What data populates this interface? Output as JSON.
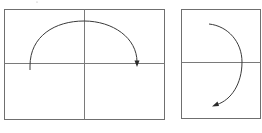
{
  "colors": {
    "frame": "#6f6f6f",
    "axis": "#7a7a7a",
    "arc": "#3a3a3a",
    "background": "#ffffff"
  },
  "panels": [
    {
      "name": "left-panel",
      "description": "semicircular arc clockwise over the horizontal axis, arrow at right end",
      "box": {
        "x": 4.5,
        "y": 9.5,
        "w": 160,
        "h": 110
      },
      "hline_y": 63.5,
      "vline_x": 84.5,
      "arc_path": "M 30 70 L 30 66 C 30 36 55 21 84 21 C 113 21 137 38 137 62",
      "arrow": {
        "tip": [
          137,
          66
        ],
        "dir": "down"
      }
    },
    {
      "name": "right-panel",
      "description": "half arc clockwise on the right side, arrow pointing down-left",
      "box": {
        "x": 181.5,
        "y": 9.5,
        "w": 79,
        "h": 109
      },
      "hline_y": 62.5,
      "arc_path": "M 209 24 C 228 26 242 42 242 62 C 242 84 231 100 217 105",
      "arrow": {
        "tip": [
          213,
          106
        ],
        "dir": "down-left"
      }
    }
  ],
  "marks": [
    {
      "name": "stray-dot",
      "x": 37,
      "y": 2
    }
  ]
}
